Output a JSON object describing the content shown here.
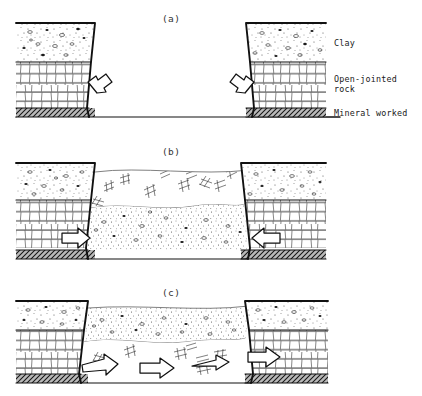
{
  "figure": {
    "title_present": false,
    "panels": [
      {
        "id": "a",
        "label": "(a)",
        "caption_text": "(a)"
      },
      {
        "id": "b",
        "label": "(b)",
        "caption_text": "(b)"
      },
      {
        "id": "c",
        "label": "(c)",
        "caption_text": "(c)"
      }
    ]
  },
  "legend": {
    "items": [
      {
        "key": "clay",
        "label": "Clay"
      },
      {
        "key": "rock",
        "label": "Open-jointed",
        "label2": "rock"
      },
      {
        "key": "mineral",
        "label": "Mineral worked"
      }
    ],
    "clay_label": "Clay",
    "rock_label_line1": "Open-jointed",
    "rock_label_line2": "rock",
    "mineral_label": "Mineral worked"
  },
  "strata": {
    "clay": {
      "name": "Clay",
      "pattern": "stipple-with-pebbles",
      "fill": "#ffffff"
    },
    "rock": {
      "name": "Open-jointed rock",
      "pattern": "irregular-brick-courses",
      "fill": "#ffffff"
    },
    "mineral": {
      "name": "Mineral worked",
      "pattern": "dense-diagonal-hatch",
      "fill": "#9a9a9a"
    },
    "backfill_fragments": {
      "name": "Collapsed rock fragments",
      "pattern": "ladder-fragments",
      "fill": "#ffffff"
    },
    "backfill_fines": {
      "name": "Migrated clay fines",
      "pattern": "dense-stipple",
      "fill": "#ffffff"
    }
  },
  "arrows": {
    "panel_a": [
      {
        "name": "left-block-collapse-arrow",
        "direction": "down-right",
        "style": "outlined"
      },
      {
        "name": "right-block-collapse-arrow",
        "direction": "down-left",
        "style": "outlined"
      }
    ],
    "panel_b": [
      {
        "name": "left-inflow-arrow",
        "direction": "right",
        "style": "outlined"
      },
      {
        "name": "right-inflow-arrow",
        "direction": "left",
        "style": "outlined"
      }
    ],
    "panel_c": [
      {
        "name": "migration-arrow-1",
        "direction": "right",
        "style": "outlined"
      },
      {
        "name": "migration-arrow-2",
        "direction": "right",
        "style": "outlined"
      },
      {
        "name": "migration-arrow-3",
        "direction": "right",
        "style": "outlined"
      },
      {
        "name": "right-block-arrow",
        "direction": "right",
        "style": "outlined"
      }
    ]
  },
  "colors": {
    "ink": "#111111",
    "hatch_ink": "#333333",
    "mineral_fill": "#9a9a9a",
    "background": "#ffffff"
  }
}
